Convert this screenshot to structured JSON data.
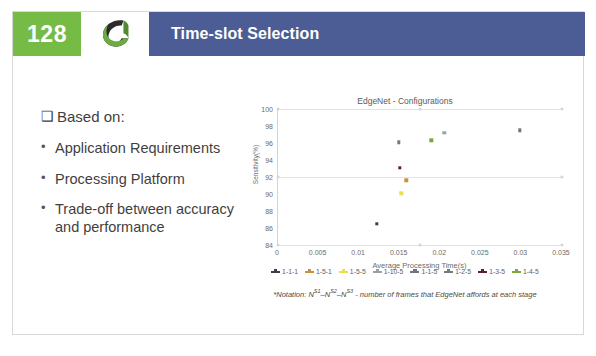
{
  "header": {
    "slide_number": "128",
    "title": "Time-slot Selection",
    "logo_icon": "swirl-ribbon-logo",
    "accent_green": "#76bb45",
    "accent_blue": "#4c5d96"
  },
  "content": {
    "lead": "Based on:",
    "lead_marker": "❑",
    "bullets": [
      "Application Requirements",
      "Processing Platform",
      "Trade-off between accuracy and performance"
    ],
    "bullet_marker": "•"
  },
  "chart_data": {
    "type": "scatter",
    "title": "EdgeNet - Configurations",
    "xlabel": "Average Processing Time(s)",
    "ylabel": "Sensitivity(%)",
    "xlim": [
      0,
      0.035
    ],
    "ylim": [
      84,
      100
    ],
    "xticks": [
      0,
      0.005,
      0.01,
      0.015,
      0.02,
      0.025,
      0.03,
      0.035
    ],
    "xtick_labels": [
      "0",
      "0.005",
      "0.01",
      "0.015",
      "0.02",
      "0.025",
      "0.03",
      "0.035"
    ],
    "yticks": [
      84,
      86,
      88,
      90,
      92,
      94,
      96,
      98,
      100
    ],
    "ytick_labels": [
      "84",
      "86",
      "88",
      "90",
      "92",
      "94",
      "96",
      "98",
      "100"
    ],
    "grid": true,
    "legend_position": "bottom",
    "series": [
      {
        "name": "1-1-1",
        "color": "#3a3f4a",
        "x": [
          0.0122
        ],
        "y": [
          86.5
        ]
      },
      {
        "name": "1-5-1",
        "color": "#c8923a",
        "x": [
          0.0158
        ],
        "y": [
          91.6
        ]
      },
      {
        "name": "1-5-5",
        "color": "#e9df54",
        "x": [
          0.0152
        ],
        "y": [
          90.1
        ]
      },
      {
        "name": "1-10-5",
        "color": "#9aa0a8",
        "x": [
          0.0205
        ],
        "y": [
          97.2
        ]
      },
      {
        "name": "1-1-5",
        "color": "#6d7584",
        "x": [
          0.0298
        ],
        "y": [
          97.5
        ]
      },
      {
        "name": "1-2-5",
        "color": "#6f7a86",
        "x": [
          0.0149
        ],
        "y": [
          96.1
        ]
      },
      {
        "name": "1-3-5",
        "color": "#5a2230",
        "x": [
          0.015
        ],
        "y": [
          93.1
        ]
      },
      {
        "name": "1-4-5",
        "color": "#7aa83c",
        "x": [
          0.0189
        ],
        "y": [
          96.3
        ]
      }
    ],
    "axis_markers": [
      {
        "x": 0.0175,
        "y": 100
      },
      {
        "x": 0.035,
        "y": 100
      },
      {
        "x": 0.0,
        "y": 100
      },
      {
        "x": 0.0,
        "y": 92
      },
      {
        "x": 0.035,
        "y": 92
      },
      {
        "x": 0.0,
        "y": 84
      },
      {
        "x": 0.0175,
        "y": 84
      },
      {
        "x": 0.035,
        "y": 84
      }
    ]
  },
  "footnote": {
    "prefix": "*Notation: N",
    "sup1": "S1",
    "dash1": "–N",
    "sup2": "S2",
    "dash2": "–N",
    "sup3": "S3",
    "suffix": " - number of frames that EdgeNet affords at each stage"
  }
}
